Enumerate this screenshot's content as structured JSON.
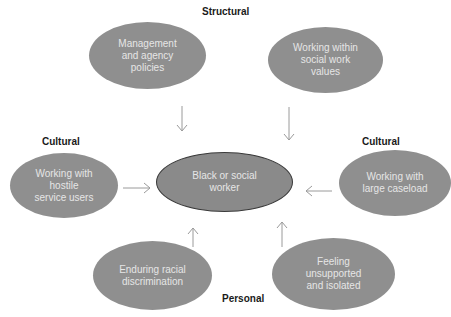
{
  "diagram": {
    "labels": {
      "structural": "Structural",
      "cultural_left": "Cultural",
      "cultural_right": "Cultural",
      "personal": "Personal"
    },
    "center": {
      "text": "Black or social\nworker"
    },
    "nodes": {
      "management": {
        "text": "Management\nand agency\npolicies",
        "category": "Structural"
      },
      "values": {
        "text": "Working within\nsocial work\nvalues",
        "category": "Structural"
      },
      "hostile": {
        "text": "Working with\nhostile\nservice users",
        "category": "Cultural"
      },
      "caseload": {
        "text": "Working with\nlarge caseload",
        "category": "Cultural"
      },
      "racial": {
        "text": "Enduring racial\ndiscrimination",
        "category": "Personal"
      },
      "unsupported": {
        "text": "Feeling\nunsupported\nand isolated",
        "category": "Personal"
      }
    },
    "edges": [
      {
        "from": "management",
        "to": "center"
      },
      {
        "from": "values",
        "to": "center"
      },
      {
        "from": "hostile",
        "to": "center"
      },
      {
        "from": "caseload",
        "to": "center"
      },
      {
        "from": "racial",
        "to": "center"
      },
      {
        "from": "unsupported",
        "to": "center"
      }
    ],
    "colors": {
      "node_fill": "#8f8f8f",
      "node_text": "#e6e6e6",
      "center_border": "#3a3a3a",
      "arrow": "#9a9a9a",
      "label": "#1a1a1a"
    }
  }
}
